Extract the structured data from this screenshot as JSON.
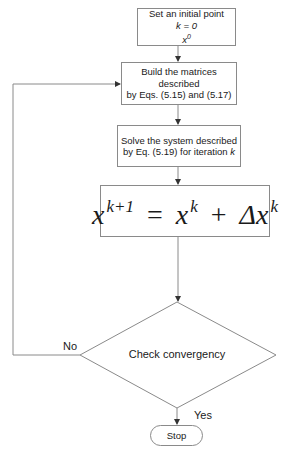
{
  "flowchart": {
    "start_box": {
      "line1": "Set an initial point",
      "line2": "k = 0",
      "line3_base": "x",
      "line3_sup": "0"
    },
    "build_box": {
      "line1": "Build the matrices described",
      "line2": "by Eqs. (5.15) and (5.17)"
    },
    "solve_box": {
      "line1": "Solve the system described",
      "line2_prefix": "by Eq. (5.19) for iteration ",
      "line2_var": "k"
    },
    "update_box": {
      "lhs_var": "x",
      "lhs_sup": "k+1",
      "equals": "=",
      "rhs1_var": "x",
      "rhs1_sup": "k",
      "plus": "+",
      "rhs2_var": "Δx",
      "rhs2_sup": "k"
    },
    "decision": {
      "text": "Check convergency",
      "no_label": "No",
      "yes_label": "Yes"
    },
    "end": {
      "text": "Stop"
    }
  },
  "colors": {
    "line": "#8a8a8a",
    "text": "#1a1a1a",
    "background": "#ffffff"
  }
}
